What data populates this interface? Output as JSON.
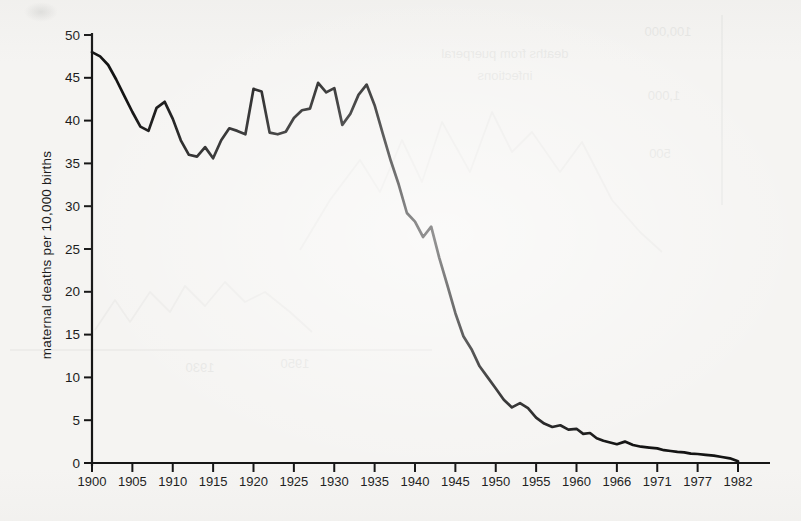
{
  "page": {
    "kind": "scanned book page with statistical chart",
    "background_color": "#f5f4f2",
    "ink_color": "#161616",
    "bleed_color": "#8a908c"
  },
  "chart_data": {
    "type": "line",
    "title": "",
    "xlabel": "",
    "ylabel": "maternal deaths per 10,000 births",
    "ylim": [
      0,
      50
    ],
    "grid": false,
    "legend": "none",
    "y_ticks": [
      "0",
      "5",
      "10",
      "15",
      "20",
      "25",
      "30",
      "35",
      "40",
      "45",
      "50"
    ],
    "y_tick_values": [
      0,
      5,
      10,
      15,
      20,
      25,
      30,
      35,
      40,
      45,
      50
    ],
    "x_tick_labels": [
      "1900",
      "1905",
      "1910",
      "1915",
      "1920",
      "1925",
      "1930",
      "1935",
      "1940",
      "1945",
      "1950",
      "1955",
      "1960",
      "1966",
      "1971",
      "1977",
      "1982"
    ],
    "x_tick_years": [
      1900,
      1905,
      1910,
      1915,
      1920,
      1925,
      1930,
      1935,
      1940,
      1945,
      1950,
      1955,
      1960,
      1966,
      1971,
      1977,
      1982
    ],
    "x_axis_note": "tick marks equally spaced although year intervals become irregular after 1960",
    "x_start_year": 1900,
    "values": [
      48.0,
      47.5,
      46.5,
      44.8,
      42.9,
      41.0,
      39.3,
      38.8,
      41.5,
      42.2,
      40.2,
      37.7,
      36.0,
      35.8,
      36.9,
      35.6,
      37.7,
      39.1,
      38.8,
      38.4,
      43.7,
      43.4,
      38.6,
      38.4,
      38.7,
      40.3,
      41.2,
      41.4,
      44.4,
      43.3,
      43.8,
      39.5,
      40.8,
      43.0,
      44.2,
      41.8,
      38.5,
      35.3,
      32.5,
      29.2,
      28.2,
      26.4,
      27.6,
      24.0,
      20.8,
      17.5,
      14.8,
      13.3,
      11.3,
      10.0,
      8.7,
      7.4,
      6.5,
      7.0,
      6.4,
      5.3,
      4.6,
      4.2,
      4.4,
      3.9,
      4.0,
      3.4,
      3.5,
      2.9,
      2.6,
      2.4,
      2.2,
      2.5,
      2.1,
      1.9,
      1.8,
      1.7,
      1.5,
      1.4,
      1.3,
      1.25,
      1.1,
      1.05,
      0.95,
      0.85,
      0.7,
      0.55,
      0.2
    ]
  },
  "bleedthrough": {
    "note": "faint mirrored show-through of chart on reverse page",
    "texts": [
      {
        "label": "100,000",
        "x": 668,
        "y": 36,
        "size": 13
      },
      {
        "label": "deaths from puerperal",
        "x": 505,
        "y": 58,
        "size": 13
      },
      {
        "label": "infections",
        "x": 505,
        "y": 80,
        "size": 13
      },
      {
        "label": "1,000",
        "x": 664,
        "y": 100,
        "size": 13
      },
      {
        "label": "500",
        "x": 660,
        "y": 158,
        "size": 13
      },
      {
        "label": "1930",
        "x": 200,
        "y": 372,
        "size": 13
      },
      {
        "label": "1950",
        "x": 295,
        "y": 368,
        "size": 13
      }
    ],
    "lines": [
      {
        "x1": 10,
        "y1": 350,
        "x2": 432,
        "y2": 350
      },
      {
        "x1": 722,
        "y1": 15,
        "x2": 722,
        "y2": 205
      }
    ],
    "curves": [
      {
        "pts": "300,250 330,200 360,160 380,192 402,140 422,182 442,122 470,172 492,112 512,152 532,132 560,172 582,142 612,200 640,232 662,252"
      },
      {
        "pts": "95,330 115,300 130,322 150,292 170,312 185,286 205,306 225,282 245,302 265,292 290,312 312,332"
      }
    ]
  }
}
